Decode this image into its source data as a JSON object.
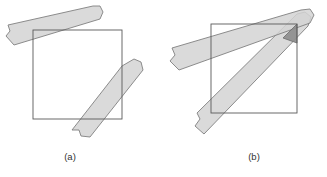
{
  "figure": {
    "type": "geometry-diagram",
    "background_color": "#ffffff",
    "panels": [
      {
        "id": "panel-a",
        "caption": "(a)",
        "caption_position": {
          "x": 70,
          "y": 160
        },
        "square": {
          "name": "unit-square",
          "x": 33,
          "y": 30,
          "width": 89,
          "height": 89,
          "stroke": "#595959",
          "stroke_width": 0.9,
          "fill": "none"
        },
        "strips": [
          {
            "name": "strip-upper-left",
            "fill": "#d4d4d4",
            "fill_opacity": 0.85,
            "stroke": "#808080",
            "stroke_width": 0.9,
            "cap_start": "torn",
            "cap_end": "rounded",
            "points": "8,25 10,31 6,36 14,45 100,19 103,12 100,6 93,6"
          },
          {
            "name": "strip-lower-right",
            "fill": "#d4d4d4",
            "fill_opacity": 0.85,
            "stroke": "#808080",
            "stroke_width": 0.9,
            "cap_start": "rounded",
            "cap_end": "torn",
            "points": "122,66 134,59 141,62 143,70 90,137 81,136 79,130 72,130"
          }
        ]
      },
      {
        "id": "panel-b",
        "caption": "(b)",
        "caption_position": {
          "x": 254,
          "y": 160
        },
        "square": {
          "name": "unit-square",
          "x": 211,
          "y": 24,
          "width": 86,
          "height": 89,
          "stroke": "#595959",
          "stroke_width": 0.9,
          "fill": "none"
        },
        "strips": [
          {
            "name": "strip-shallow",
            "fill": "#d4d4d4",
            "fill_opacity": 0.85,
            "stroke": "#808080",
            "stroke_width": 0.9,
            "cap_start": "torn",
            "cap_end": "rounded",
            "points": "172,48 175,55 170,61 179,70 310,23 314,15 310,9 301,10"
          },
          {
            "name": "strip-steep",
            "fill": "#d4d4d4",
            "fill_opacity": 0.85,
            "stroke": "#808080",
            "stroke_width": 0.9,
            "cap_start": "torn",
            "cap_end": "rounded",
            "points": "197,113 200,119 195,126 204,134 308,26 311,17 305,12 297,14"
          }
        ],
        "overlap_region": {
          "name": "strip-intersection",
          "fill": "#8c8c8c",
          "fill_opacity": 0.9,
          "stroke": "#6b6b6b",
          "stroke_width": 0.8,
          "points": "283,38 297,24 297,43 "
        }
      }
    ],
    "colors": {
      "strip_fill": "#d4d4d4",
      "strip_stroke": "#808080",
      "square_stroke": "#595959",
      "overlap_fill": "#8c8c8c",
      "caption_color": "#333333",
      "background": "#ffffff"
    }
  }
}
